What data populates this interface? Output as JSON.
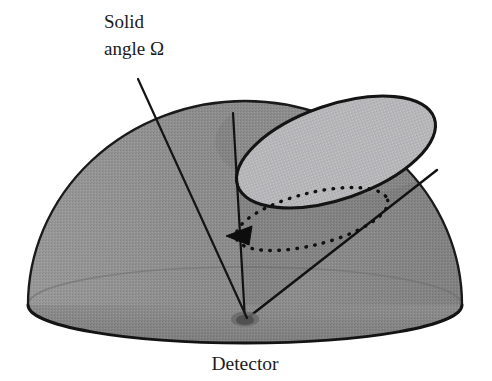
{
  "figure": {
    "title_text": "Solid angle detector acceptance diagram",
    "background_color": "#ffffff",
    "labels": {
      "solid_angle_line1": "Solid",
      "solid_angle_line2": "angle Ω",
      "detector": "Detector"
    },
    "colors": {
      "dome_fill": "#8d8d8d",
      "dome_outline": "#1a1a1a",
      "cone_aperture_fill": "#b5b5b8",
      "cone_line": "#111111",
      "dotted_arc": "#101010",
      "leader_line": "#141414",
      "detector_spot": "#5c5c5c",
      "text": "#1b1b1b",
      "base_shade": "#7f7f7f"
    },
    "geometry": {
      "dome": {
        "apex_y": 101,
        "base_center_x": 245,
        "base_center_y": 305,
        "base_rx": 217,
        "base_ry": 38,
        "dome_ry": 204
      },
      "detector_point": {
        "x": 245,
        "y": 320
      },
      "aperture_ellipse": {
        "cx": 336,
        "cy": 152,
        "rx": 104,
        "ry": 47,
        "rotation_deg": -19
      },
      "solid_angle_dotted_ellipse": {
        "cx": 312,
        "cy": 219,
        "rx": 78,
        "ry": 26,
        "rotation_deg": -14
      },
      "arrowhead": {
        "x": 240,
        "y": 233,
        "angle_deg": 205
      },
      "leader_line": {
        "x1": 138,
        "y1": 79,
        "x2": 247,
        "y2": 318
      },
      "cone_edge_left": {
        "x1": 233,
        "y1": 113,
        "x2": 245,
        "y2": 320
      },
      "cone_edge_right": {
        "x1": 437,
        "y1": 170,
        "x2": 245,
        "y2": 320
      }
    },
    "annotations": {
      "solid_angle_text_x": 104,
      "solid_angle_text_y": 28,
      "detector_text_x": 245,
      "detector_text_y": 370
    }
  }
}
